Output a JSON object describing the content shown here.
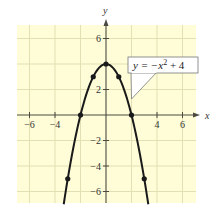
{
  "chart_data": {
    "type": "line",
    "title": "",
    "equation": "y = -x^2 + 4",
    "equation_parts": {
      "lhs": "y = −x",
      "sup": "2",
      "rhs": " + 4"
    },
    "xlabel": "x",
    "ylabel": "y",
    "xlim": [
      -7,
      7
    ],
    "ylim": [
      -7,
      7
    ],
    "grid": true,
    "x_ticks": [
      -6,
      -4,
      4,
      6
    ],
    "y_ticks": [
      6,
      2,
      -2,
      -4,
      -6
    ],
    "x_tick_labels": [
      "−6",
      "−4",
      "4",
      "6"
    ],
    "y_tick_labels": [
      "6",
      "2",
      "−2",
      "−4",
      "−6"
    ],
    "series": [
      {
        "name": "y = -x^2 + 4",
        "function": "-x^2+4",
        "points": [
          {
            "x": -3,
            "y": -5
          },
          {
            "x": -2,
            "y": 0
          },
          {
            "x": -1,
            "y": 3
          },
          {
            "x": 0,
            "y": 4
          },
          {
            "x": 1,
            "y": 3
          },
          {
            "x": 2,
            "y": 0
          },
          {
            "x": 3,
            "y": -5
          }
        ]
      }
    ],
    "annotations": [
      {
        "text": "y = −x² + 4",
        "type": "callout",
        "points_to": {
          "x": 1.9,
          "y": 1.2
        }
      }
    ]
  },
  "colors": {
    "background": "#fefdd8",
    "grid": "#e2dfb2",
    "axis": "#4a4a40",
    "curve": "#1a1a1a",
    "callout_bg": "#ffffff",
    "callout_border": "#777777"
  }
}
